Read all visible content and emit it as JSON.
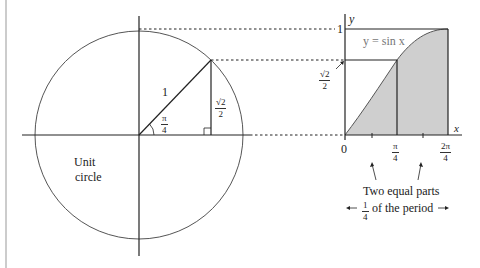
{
  "figure": {
    "unit_circle_label_line1": "Unit",
    "unit_circle_label_line2": "circle",
    "radius_label": "1",
    "angle_label": {
      "num": "π",
      "den": "4"
    },
    "opposite_side_label": {
      "num": "√2",
      "den": "2"
    },
    "graph": {
      "y_axis_label": "y",
      "x_axis_label": "x",
      "y_tick_one": "1",
      "y_tick_sqrt2_over_2": {
        "num": "√2",
        "den": "2"
      },
      "curve_label": "y = sin x",
      "x_tick_zero": "0",
      "x_tick_pi_over_4": {
        "num": "π",
        "den": "4"
      },
      "x_tick_2pi_over_4": {
        "num": "2π",
        "den": "4"
      }
    },
    "annotation_line1": "Two equal parts",
    "annotation_line2_fraction": {
      "num": "1",
      "den": "4"
    },
    "annotation_line2_text": "of the period",
    "colors": {
      "line": "#222222",
      "circle": "#555555",
      "shade": "#cfcfcf",
      "dotted": "#222222",
      "curve_label": "#777777"
    }
  }
}
